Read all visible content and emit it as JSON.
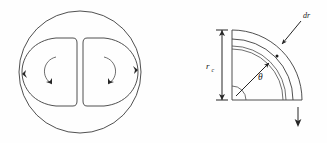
{
  "figure": {
    "background_color": "#fefefe",
    "line_color": "#3c3c3c",
    "label_color": "#1a1a1a",
    "width": 327,
    "height": 143
  },
  "left_panel": {
    "name": "vortex-cross-section",
    "description": "Circle containing two mirrored D-shaped streamline loops with circulation arrows",
    "outer_circle": {
      "center_x": 80,
      "center_y": 72,
      "radius": 61
    },
    "left_loop": {
      "label": "left-vortex-loop",
      "rotation": "counter-clockwise"
    },
    "right_loop": {
      "label": "right-vortex-loop",
      "rotation": "clockwise"
    },
    "arrow_count": 4
  },
  "right_panel": {
    "name": "polar-area-element",
    "description": "Quarter circle sector with annular element of thickness dr at radius r and angle theta",
    "origin_x": 232,
    "origin_y": 100,
    "radius": 70,
    "band_thickness": 9,
    "inner_band_offset": 16,
    "labels": {
      "radius_symbol": "r",
      "radius_subscript": "c",
      "angle_symbol": "θ",
      "thickness_symbol": "dr"
    },
    "annotations": {
      "dimension_line": "r_c vertical dimension with double arrowheads",
      "leader_line": "dr leader pointing to outer annular band",
      "angle_arc": "small arc at origin marking theta",
      "radial_arrow": "arrow from origin to point on element",
      "down_arrow": "downward arrow below bottom-right of sector"
    }
  }
}
